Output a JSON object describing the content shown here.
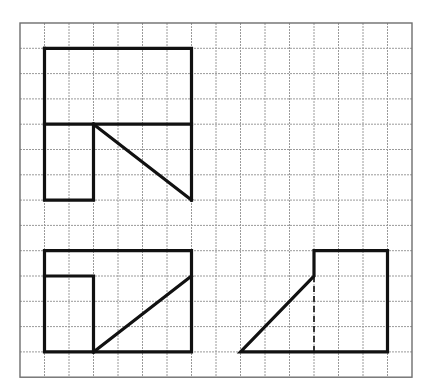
{
  "figure": {
    "type": "orthographic-projection-views",
    "grid": {
      "origin_x": 20,
      "origin_y": 23,
      "cell_w": 24.5,
      "cell_h": 25.3,
      "cols": 16,
      "rows": 14,
      "line_color": "#9a9a9a",
      "border_color": "#6e6e6e"
    },
    "colors": {
      "outline": "#111111",
      "background": "#ffffff"
    },
    "views": [
      {
        "name": "top-view",
        "polylines": [
          [
            [
              1,
              1
            ],
            [
              7,
              1
            ],
            [
              7,
              7
            ]
          ],
          [
            [
              1,
              1
            ],
            [
              1,
              7
            ],
            [
              3,
              7
            ],
            [
              3,
              4
            ]
          ],
          [
            [
              1,
              4
            ],
            [
              7,
              4
            ]
          ],
          [
            [
              3,
              4
            ],
            [
              7,
              7
            ]
          ]
        ],
        "dashed": []
      },
      {
        "name": "front-view",
        "polylines": [
          [
            [
              1,
              9
            ],
            [
              7,
              9
            ],
            [
              7,
              13
            ],
            [
              1,
              13
            ],
            [
              1,
              9
            ]
          ],
          [
            [
              1,
              10
            ],
            [
              3,
              10
            ],
            [
              3,
              13
            ]
          ],
          [
            [
              3,
              13
            ],
            [
              7,
              10
            ]
          ]
        ],
        "dashed": []
      },
      {
        "name": "side-view",
        "polylines": [
          [
            [
              12,
              9
            ],
            [
              15,
              9
            ],
            [
              15,
              13
            ],
            [
              9,
              13
            ],
            [
              12,
              10
            ],
            [
              12,
              9
            ]
          ]
        ],
        "dashed": [
          [
            [
              12,
              10
            ],
            [
              12,
              13
            ]
          ]
        ]
      }
    ]
  }
}
